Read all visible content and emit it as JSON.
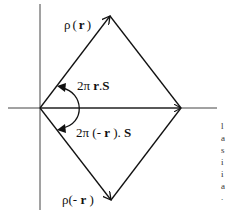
{
  "diagram": {
    "type": "vector-diagram",
    "axes": {
      "horizontal": {
        "x1": 8,
        "y1": 108,
        "x2": 217,
        "y2": 108
      },
      "vertical": {
        "x1": 40,
        "y1": 4,
        "x2": 40,
        "y2": 210
      }
    },
    "origin": {
      "x": 40,
      "y": 108
    },
    "vertices": {
      "top": {
        "x": 110,
        "y": 16
      },
      "right": {
        "x": 181,
        "y": 108
      },
      "bottom": {
        "x": 111,
        "y": 200
      }
    },
    "labels": {
      "rho_r": {
        "rho": "ρ",
        "open": "(",
        "var": "r",
        "close": ")"
      },
      "phase_r": {
        "prefix": "2π ",
        "var": "r",
        "suffix": ".",
        "s": "S"
      },
      "phase_neg_r": {
        "prefix": "2π (- ",
        "var": "r",
        "suffix": " ). ",
        "s": "S"
      },
      "rho_neg_r": {
        "rho": "ρ",
        "open": "(- ",
        "var": "r",
        "close": " )"
      }
    },
    "right_edge_fragments": [
      "l",
      "a",
      "s",
      "i",
      "i",
      "a",
      "."
    ],
    "colors": {
      "line": "#111111",
      "background": "#ffffff"
    }
  }
}
